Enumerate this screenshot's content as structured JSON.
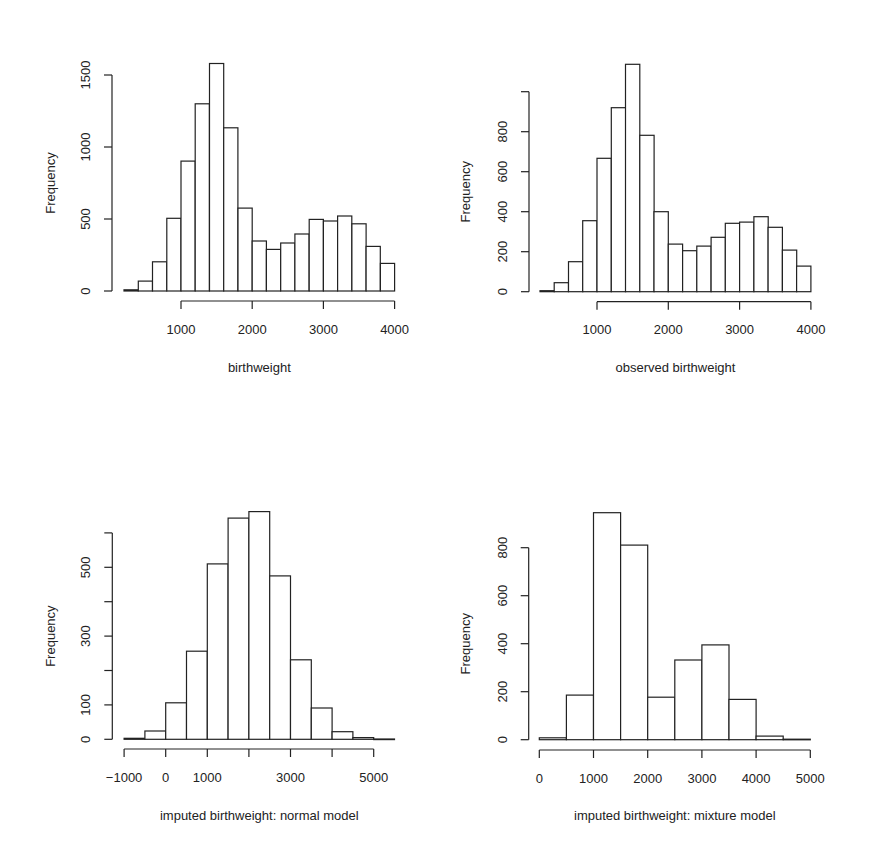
{
  "figure": {
    "background": "#ffffff",
    "stroke_color": "#222222"
  },
  "chart_data": [
    {
      "id": "top-left",
      "type": "bar",
      "subtype": "histogram",
      "title": "",
      "xlabel": "birthweight",
      "ylabel": "Frequency",
      "bin_edges": [
        200,
        400,
        600,
        800,
        1000,
        1200,
        1400,
        1600,
        1800,
        2000,
        2200,
        2400,
        2600,
        2800,
        3000,
        3200,
        3400,
        3600,
        3800,
        4000
      ],
      "values": [
        8,
        69,
        203,
        505,
        902,
        1300,
        1580,
        1133,
        576,
        347,
        289,
        333,
        396,
        497,
        486,
        521,
        467,
        310,
        192
      ],
      "xticks": [
        1000,
        2000,
        3000,
        4000
      ],
      "xtick_labels": [
        "1000",
        "2000",
        "3000",
        "4000"
      ],
      "xaxis_range": [
        1000,
        4000
      ],
      "yticks": [
        0,
        500,
        1000,
        1500
      ],
      "ytick_labels": [
        "0",
        "500",
        "1000",
        "1500"
      ],
      "ylim": [
        0,
        1600
      ],
      "grid": false,
      "legend": null,
      "layout": {
        "x0_val": 1000,
        "x0_px": 181,
        "px_per_unit": 0.0712,
        "y0_px": 291,
        "px_per_yunit": 0.144,
        "yaxis_px": 112,
        "xaxis_line_px": 301,
        "xlabel_px": 334,
        "title_px": 372,
        "ylabel_x_px": 55
      }
    },
    {
      "id": "top-right",
      "type": "bar",
      "subtype": "histogram",
      "title": "",
      "xlabel": "observed birthweight",
      "ylabel": "Frequency",
      "bin_edges": [
        200,
        400,
        600,
        800,
        1000,
        1200,
        1400,
        1600,
        1800,
        2000,
        2200,
        2400,
        2600,
        2800,
        3000,
        3200,
        3400,
        3600,
        3800,
        4000
      ],
      "values": [
        5,
        45,
        150,
        355,
        667,
        920,
        1137,
        782,
        400,
        238,
        205,
        228,
        272,
        342,
        348,
        375,
        322,
        208,
        128
      ],
      "xticks": [
        1000,
        2000,
        3000,
        4000
      ],
      "xtick_labels": [
        "1000",
        "2000",
        "3000",
        "4000"
      ],
      "xaxis_range": [
        1000,
        4000
      ],
      "yticks": [
        0,
        200,
        400,
        600,
        800,
        1000
      ],
      "ytick_labels": [
        "0",
        "200",
        "400",
        "600",
        "800",
        ""
      ],
      "ylim": [
        0,
        1150
      ],
      "grid": false,
      "legend": null,
      "layout": {
        "x0_val": 1000,
        "x0_px": 597,
        "px_per_unit": 0.0713,
        "y0_px": 291.7,
        "px_per_yunit": 0.2,
        "yaxis_px": 529,
        "xaxis_line_px": 301.7,
        "xlabel_px": 334,
        "title_px": 372,
        "ylabel_x_px": 470
      }
    },
    {
      "id": "bottom-left",
      "type": "bar",
      "subtype": "histogram",
      "title": "",
      "xlabel": "imputed birthweight: normal model",
      "ylabel": "Frequency",
      "bin_edges": [
        -1000,
        -500,
        0,
        500,
        1000,
        1500,
        2000,
        2500,
        3000,
        3500,
        4000,
        4500,
        5000,
        5500
      ],
      "values": [
        3,
        24,
        106,
        256,
        510,
        643,
        662,
        475,
        231,
        91,
        22,
        5,
        1
      ],
      "xticks": [
        -1000,
        0,
        1000,
        2000,
        3000,
        4000,
        5000
      ],
      "xtick_labels": [
        "−1000",
        "0",
        "1000",
        "",
        "3000",
        "",
        "5000"
      ],
      "xaxis_range": [
        -1000,
        5000
      ],
      "yticks": [
        0,
        100,
        200,
        300,
        400,
        500,
        600
      ],
      "ytick_labels": [
        "0",
        "100",
        "",
        "300",
        "",
        "500",
        ""
      ],
      "ylim": [
        0,
        680
      ],
      "grid": false,
      "legend": null,
      "layout": {
        "x0_val": 0,
        "x0_px": 165.7,
        "px_per_unit": 0.0416,
        "y0_px": 739.3,
        "px_per_yunit": 0.344,
        "yaxis_px": 112.3,
        "xaxis_line_px": 749,
        "xlabel_px": 782,
        "title_px": 820,
        "ylabel_x_px": 55
      }
    },
    {
      "id": "bottom-right",
      "type": "bar",
      "subtype": "histogram",
      "title": "",
      "xlabel": "imputed birthweight: mixture model",
      "ylabel": "Frequency",
      "bin_edges": [
        0,
        500,
        1000,
        1500,
        2000,
        2500,
        3000,
        3500,
        4000,
        4500,
        5000
      ],
      "values": [
        8,
        186,
        946,
        811,
        177,
        332,
        395,
        168,
        15,
        2
      ],
      "xticks": [
        0,
        1000,
        2000,
        3000,
        4000,
        5000
      ],
      "xtick_labels": [
        "0",
        "1000",
        "2000",
        "3000",
        "4000",
        "5000"
      ],
      "xaxis_range": [
        0,
        5000
      ],
      "yticks": [
        0,
        200,
        400,
        600,
        800
      ],
      "ytick_labels": [
        "0",
        "200",
        "400",
        "600",
        "800"
      ],
      "ylim": [
        0,
        950
      ],
      "grid": false,
      "legend": null,
      "layout": {
        "x0_val": 0,
        "x0_px": 539.3,
        "px_per_unit": 0.0542,
        "y0_px": 739.7,
        "px_per_yunit": 0.24,
        "yaxis_px": 528.7,
        "xaxis_line_px": 750,
        "xlabel_px": 783,
        "title_px": 820,
        "ylabel_x_px": 470
      }
    }
  ]
}
